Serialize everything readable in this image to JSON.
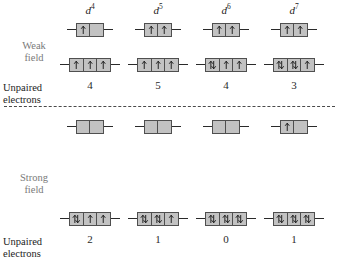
{
  "labels": {
    "weak_field": "Weak\nfield",
    "strong_field": "Strong\nfield",
    "unpaired_weak": "Unpaired\nelectrons",
    "unpaired_strong": "Unpaired\nelectrons"
  },
  "colors": {
    "box_fill": "#c2c2c2",
    "box_border": "#4f4f4f",
    "line": "#2a2a2a",
    "label_gray": "#7a7a7a",
    "label_dark": "#1c1c1c",
    "divider": "#4a4a4a",
    "background": "#ffffff"
  },
  "columns": [
    {
      "config_base": "d",
      "config_sup": "4",
      "weak": {
        "eg": [
          "up",
          "empty"
        ],
        "t2g": [
          "up",
          "up",
          "up"
        ],
        "unpaired": "4"
      },
      "strong": {
        "eg": [
          "empty",
          "empty"
        ],
        "t2g": [
          "pair",
          "up",
          "up"
        ],
        "unpaired": "2"
      }
    },
    {
      "config_base": "d",
      "config_sup": "5",
      "weak": {
        "eg": [
          "up",
          "up"
        ],
        "t2g": [
          "up",
          "up",
          "up"
        ],
        "unpaired": "5"
      },
      "strong": {
        "eg": [
          "empty",
          "empty"
        ],
        "t2g": [
          "pair",
          "pair",
          "up"
        ],
        "unpaired": "1"
      }
    },
    {
      "config_base": "d",
      "config_sup": "6",
      "weak": {
        "eg": [
          "up",
          "up"
        ],
        "t2g": [
          "pair",
          "up",
          "up"
        ],
        "unpaired": "4"
      },
      "strong": {
        "eg": [
          "empty",
          "empty"
        ],
        "t2g": [
          "pair",
          "pair",
          "pair"
        ],
        "unpaired": "0"
      }
    },
    {
      "config_base": "d",
      "config_sup": "7",
      "weak": {
        "eg": [
          "up",
          "up"
        ],
        "t2g": [
          "pair",
          "pair",
          "up"
        ],
        "unpaired": "3"
      },
      "strong": {
        "eg": [
          "up",
          "empty"
        ],
        "t2g": [
          "pair",
          "pair",
          "pair"
        ],
        "unpaired": "1"
      }
    }
  ]
}
